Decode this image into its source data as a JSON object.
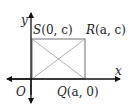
{
  "diagram": {
    "type": "coordinate-rectangle",
    "axes": {
      "x_label": "x",
      "y_label": "y",
      "origin_label": "O"
    },
    "points": {
      "S": {
        "name": "S",
        "coords": "(0, c)"
      },
      "R": {
        "name": "R",
        "coords": "(a, c)"
      },
      "Q": {
        "name": "Q",
        "coords": "(a, 0)"
      },
      "O": {
        "name": "O"
      }
    },
    "colors": {
      "axis": "#111111",
      "rectangle": "#888888",
      "diagonal": "#999999",
      "text": "#222222"
    }
  }
}
